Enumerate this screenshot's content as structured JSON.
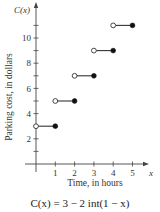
{
  "chart_data": {
    "type": "step",
    "title": "",
    "function_label": "C(x)",
    "formula": "C(x) = 3 − 2 int(1 − x)",
    "xlabel": "Time, in hours",
    "ylabel": "Parking cost, in dollars",
    "x_axis_symbol": "x",
    "x_ticks": [
      1,
      2,
      3,
      4,
      5
    ],
    "y_ticks_labeled": [
      2,
      4,
      6,
      8,
      10
    ],
    "y_ticks_minor_every": 1,
    "xlim": [
      0,
      5.5
    ],
    "ylim": [
      0,
      12.5
    ],
    "grid": false,
    "segments": [
      {
        "x_start": 0,
        "x_end": 1,
        "y": 3,
        "open_start": true,
        "closed_end": true
      },
      {
        "x_start": 1,
        "x_end": 2,
        "y": 5,
        "open_start": true,
        "closed_end": true
      },
      {
        "x_start": 2,
        "x_end": 3,
        "y": 7,
        "open_start": true,
        "closed_end": true
      },
      {
        "x_start": 3,
        "x_end": 4,
        "y": 9,
        "open_start": true,
        "closed_end": true
      },
      {
        "x_start": 4,
        "x_end": 5,
        "y": 11,
        "open_start": true,
        "closed_end": true
      }
    ]
  },
  "labels": {
    "y_axis_name": "C(x)",
    "x_axis_name": "x",
    "xlabel": "Time, in hours",
    "ylabel": "Parking cost, in dollars",
    "formula": "C(x) = 3 − 2 int(1 − x)"
  }
}
